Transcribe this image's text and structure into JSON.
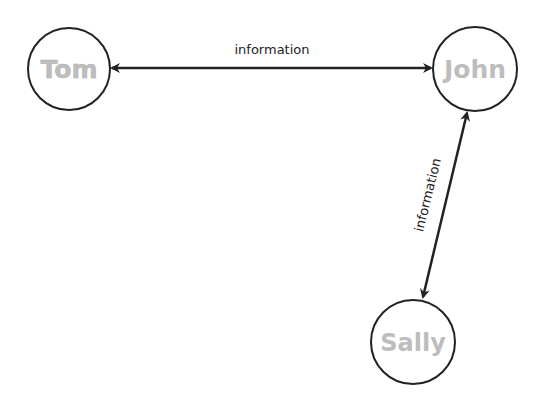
{
  "diagram": {
    "nodes": [
      {
        "id": "tom",
        "label": "Tom",
        "cx": 69,
        "cy": 69,
        "r": 41,
        "text_color": "#c4c4c4"
      },
      {
        "id": "john",
        "label": "John",
        "cx": 475,
        "cy": 69,
        "r": 42,
        "text_color": "#9a9a9a"
      },
      {
        "id": "sally",
        "label": "Sally",
        "cx": 413,
        "cy": 342,
        "r": 42,
        "text_color": "#a8a8a8"
      }
    ],
    "edges": [
      {
        "from": "tom",
        "to": "john",
        "label": "information",
        "bidirectional": true
      },
      {
        "from": "john",
        "to": "sally",
        "label": "information",
        "bidirectional": true
      }
    ],
    "colors": {
      "stroke": "#222222",
      "background": "#ffffff"
    }
  }
}
